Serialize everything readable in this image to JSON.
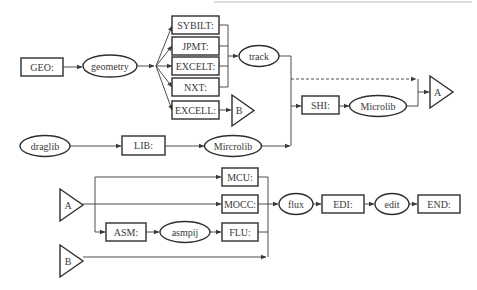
{
  "diagram": {
    "type": "flowchart",
    "top_section": {
      "geo": "GEO:",
      "geometry": "geometry",
      "tracking_modules": [
        "SYBILT:",
        "JPMT:",
        "EXCELT:",
        "NXT:"
      ],
      "excell": "EXCELL:",
      "connector_b": "B",
      "track": "track",
      "shi": "SHI:",
      "microlib": "Microlib",
      "connector_a": "A"
    },
    "library_row": {
      "draglib": "draglib",
      "lib": "LIB:",
      "mircrolib": "Mircrolib"
    },
    "bottom_section": {
      "connector_a": "A",
      "connector_b": "B",
      "mcu": "MCU:",
      "mocc": "MOCC:",
      "asm": "ASM:",
      "asmpij": "asmpij",
      "flu": "FLU:",
      "flux": "flux",
      "edi": "EDI:",
      "edit": "edit",
      "end": "END:"
    },
    "edges": [
      [
        "GEO:",
        "geometry"
      ],
      [
        "geometry",
        "SYBILT:"
      ],
      [
        "geometry",
        "JPMT:"
      ],
      [
        "geometry",
        "EXCELT:"
      ],
      [
        "geometry",
        "NXT:"
      ],
      [
        "geometry",
        "EXCELL:"
      ],
      [
        "SYBILT:",
        "track"
      ],
      [
        "JPMT:",
        "track"
      ],
      [
        "EXCELT:",
        "track"
      ],
      [
        "NXT:",
        "track"
      ],
      [
        "EXCELL:",
        "B"
      ],
      [
        "track",
        "SHI:"
      ],
      [
        "Mircrolib",
        "SHI:"
      ],
      [
        "track",
        "A",
        "dashed"
      ],
      [
        "SHI:",
        "Microlib"
      ],
      [
        "Microlib",
        "A"
      ],
      [
        "draglib",
        "LIB:"
      ],
      [
        "LIB:",
        "Mircrolib"
      ],
      [
        "A",
        "MCU:"
      ],
      [
        "A",
        "MOCC:"
      ],
      [
        "A",
        "ASM:"
      ],
      [
        "ASM:",
        "asmpij"
      ],
      [
        "asmpij",
        "FLU:"
      ],
      [
        "MCU:",
        "flux"
      ],
      [
        "MOCC:",
        "flux"
      ],
      [
        "FLU:",
        "flux"
      ],
      [
        "B",
        "flux"
      ],
      [
        "flux",
        "EDI:"
      ],
      [
        "EDI:",
        "edit"
      ],
      [
        "edit",
        "END:"
      ]
    ]
  }
}
